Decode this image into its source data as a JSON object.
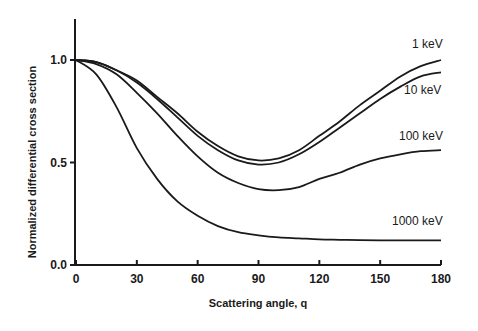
{
  "chart_data": {
    "type": "line",
    "title": "",
    "xlabel": "Scattering angle, q",
    "ylabel": "Normalized differential cross section",
    "xlim": [
      0,
      180
    ],
    "ylim": [
      0,
      1.2
    ],
    "xticks": [
      0,
      30,
      60,
      90,
      120,
      150,
      180
    ],
    "xtick_labels": [
      "0",
      "30",
      "60",
      "90",
      "120",
      "150",
      "180"
    ],
    "yticks": [
      0.0,
      0.5,
      1.0
    ],
    "ytick_labels": [
      "0.0",
      "0.5",
      "1.0"
    ],
    "grid": false,
    "legend": "inline labels at right end of curves",
    "x": [
      0,
      10,
      20,
      30,
      40,
      50,
      60,
      70,
      80,
      90,
      100,
      110,
      120,
      130,
      140,
      150,
      160,
      170,
      180
    ],
    "series": [
      {
        "name": "1 keV",
        "values": [
          1.0,
          0.99,
          0.95,
          0.9,
          0.82,
          0.74,
          0.65,
          0.58,
          0.53,
          0.51,
          0.52,
          0.56,
          0.63,
          0.7,
          0.78,
          0.85,
          0.92,
          0.97,
          1.0
        ]
      },
      {
        "name": "10 keV",
        "values": [
          1.0,
          0.99,
          0.95,
          0.89,
          0.81,
          0.72,
          0.63,
          0.56,
          0.51,
          0.49,
          0.5,
          0.54,
          0.6,
          0.67,
          0.74,
          0.81,
          0.87,
          0.92,
          0.94
        ]
      },
      {
        "name": "100 keV",
        "values": [
          1.0,
          0.98,
          0.93,
          0.84,
          0.74,
          0.63,
          0.53,
          0.45,
          0.4,
          0.37,
          0.365,
          0.38,
          0.42,
          0.45,
          0.49,
          0.52,
          0.54,
          0.555,
          0.56
        ]
      },
      {
        "name": "1000 keV",
        "values": [
          1.0,
          0.93,
          0.77,
          0.57,
          0.42,
          0.31,
          0.24,
          0.19,
          0.16,
          0.145,
          0.135,
          0.13,
          0.125,
          0.123,
          0.121,
          0.12,
          0.12,
          0.12,
          0.12
        ]
      }
    ]
  }
}
